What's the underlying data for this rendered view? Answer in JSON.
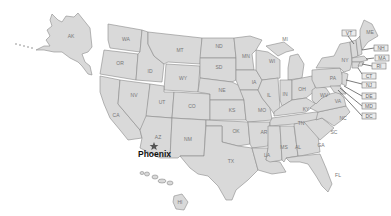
{
  "map": {
    "title": "United States",
    "fill_color": "#d9d9d9",
    "border_color": "#8a8a8a",
    "marker": {
      "city": "Phoenix",
      "state": "AZ",
      "icon": "star-icon"
    },
    "state_labels": [
      "AK",
      "WA",
      "OR",
      "ID",
      "MT",
      "WY",
      "ND",
      "SD",
      "NE",
      "MN",
      "WI",
      "MI",
      "IA",
      "IL",
      "IN",
      "OH",
      "KY",
      "TN",
      "MO",
      "KS",
      "OK",
      "TX",
      "AR",
      "LA",
      "MS",
      "AL",
      "GA",
      "FL",
      "SC",
      "NC",
      "VA",
      "WV",
      "PA",
      "NY",
      "ME",
      "CA",
      "NV",
      "UT",
      "CO",
      "AZ",
      "NM",
      "HI"
    ],
    "callout_labels": [
      "VT",
      "NH",
      "MA",
      "RI",
      "CT",
      "NJ",
      "DE",
      "MD",
      "DC"
    ]
  }
}
